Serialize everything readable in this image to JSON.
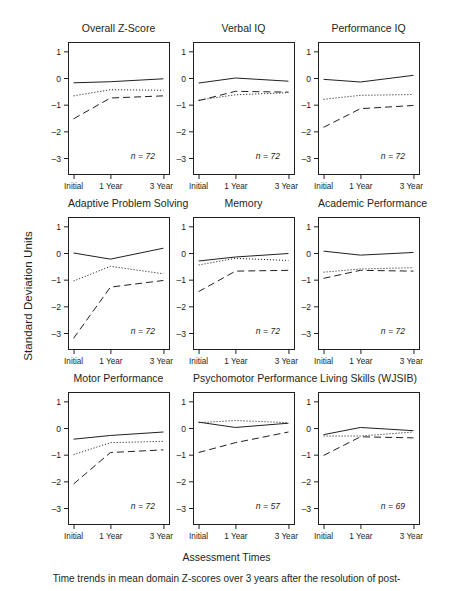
{
  "figure": {
    "ylabel": "Standard Deviation Units",
    "xlabel": "Assessment Times",
    "caption": "Time trends in mean domain Z-scores over 3 years after the resolution of post-"
  },
  "chart_data": {
    "type": "line",
    "title": "Time trends in mean domain Z-scores over 3 years after the resolution of post-",
    "xlabel": "Assessment Times",
    "ylabel": "Standard Deviation Units",
    "categories": [
      "Initial",
      "1 Year",
      "3 Year"
    ],
    "yticks": [
      1,
      0,
      -1,
      -2,
      -3
    ],
    "ylim": [
      -3.6,
      1.35
    ],
    "grid": false,
    "legend": "none",
    "series_styles": [
      "solid",
      "dotted",
      "dashed"
    ],
    "panels": [
      {
        "title": "Overall Z-Score",
        "n_label": "n = 72",
        "series": [
          {
            "name": "solid",
            "values": [
              -0.18,
              -0.14,
              -0.03
            ]
          },
          {
            "name": "dotted",
            "values": [
              -0.67,
              -0.44,
              -0.46
            ]
          },
          {
            "name": "dashed",
            "values": [
              -1.53,
              -0.75,
              -0.67
            ]
          }
        ]
      },
      {
        "title": "Verbal IQ",
        "n_label": "n = 72",
        "series": [
          {
            "name": "solid",
            "values": [
              -0.19,
              0.0,
              -0.12
            ]
          },
          {
            "name": "dotted",
            "values": [
              -0.83,
              -0.63,
              -0.55
            ]
          },
          {
            "name": "dashed",
            "values": [
              -0.85,
              -0.5,
              -0.53
            ]
          }
        ]
      },
      {
        "title": "Performance IQ",
        "n_label": "n = 72",
        "series": [
          {
            "name": "solid",
            "values": [
              -0.05,
              -0.15,
              0.1
            ]
          },
          {
            "name": "dotted",
            "values": [
              -0.8,
              -0.65,
              -0.62
            ]
          },
          {
            "name": "dashed",
            "values": [
              -1.85,
              -1.15,
              -1.03
            ]
          }
        ]
      },
      {
        "title": "Adaptive Problem Solving",
        "n_label": "n = 72",
        "series": [
          {
            "name": "solid",
            "values": [
              0.0,
              -0.23,
              0.18
            ]
          },
          {
            "name": "dotted",
            "values": [
              -1.05,
              -0.5,
              -0.78
            ]
          },
          {
            "name": "dashed",
            "values": [
              -3.2,
              -1.28,
              -1.03
            ]
          }
        ]
      },
      {
        "title": "Memory",
        "n_label": "n = 72",
        "series": [
          {
            "name": "solid",
            "values": [
              -0.3,
              -0.15,
              -0.02
            ]
          },
          {
            "name": "dotted",
            "values": [
              -0.45,
              -0.2,
              -0.28
            ]
          },
          {
            "name": "dashed",
            "values": [
              -1.45,
              -0.68,
              -0.65
            ]
          }
        ]
      },
      {
        "title": "Academic Performance",
        "n_label": "n = 72",
        "series": [
          {
            "name": "solid",
            "values": [
              0.07,
              -0.08,
              0.02
            ]
          },
          {
            "name": "dotted",
            "values": [
              -0.72,
              -0.6,
              -0.55
            ]
          },
          {
            "name": "dashed",
            "values": [
              -0.95,
              -0.65,
              -0.68
            ]
          }
        ]
      },
      {
        "title": "Motor Performance",
        "n_label": "n = 72",
        "series": [
          {
            "name": "solid",
            "values": [
              -0.42,
              -0.28,
              -0.15
            ]
          },
          {
            "name": "dotted",
            "values": [
              -1.0,
              -0.55,
              -0.5
            ]
          },
          {
            "name": "dashed",
            "values": [
              -2.1,
              -0.92,
              -0.82
            ]
          }
        ]
      },
      {
        "title": "Psychomotor Performance",
        "n_label": "n = 57",
        "series": [
          {
            "name": "solid",
            "values": [
              0.22,
              0.02,
              0.18
            ]
          },
          {
            "name": "dotted",
            "values": [
              0.2,
              0.28,
              0.2
            ]
          },
          {
            "name": "dashed",
            "values": [
              -0.92,
              -0.55,
              -0.15
            ]
          }
        ]
      },
      {
        "title": "Living Skills (WJSIB)",
        "n_label": "n = 69",
        "series": [
          {
            "name": "solid",
            "values": [
              -0.25,
              0.02,
              -0.1
            ]
          },
          {
            "name": "dotted",
            "values": [
              -0.3,
              -0.3,
              -0.15
            ]
          },
          {
            "name": "dashed",
            "values": [
              -1.03,
              -0.33,
              -0.37
            ]
          }
        ]
      }
    ]
  }
}
